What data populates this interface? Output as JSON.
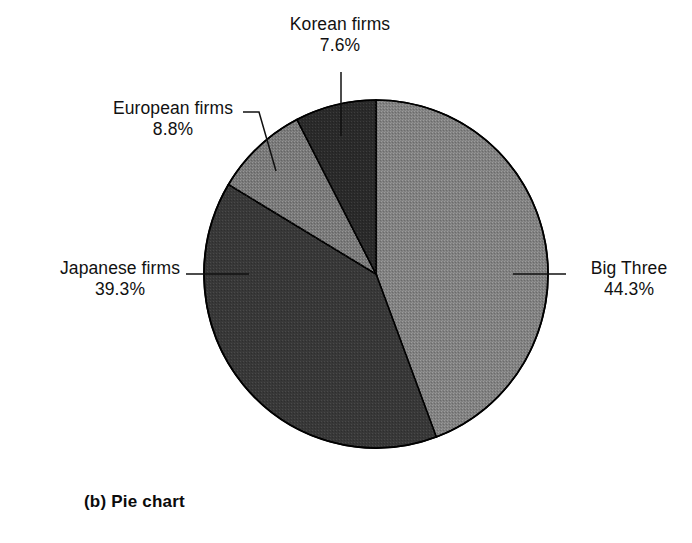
{
  "figure": {
    "caption": "(b) Pie chart",
    "background_color": "#ffffff",
    "text_color": "#111111"
  },
  "chart_data": {
    "type": "pie",
    "title": "",
    "subtitle": "",
    "xlabel": "",
    "ylabel": "",
    "grid": false,
    "legend_position": "none",
    "label_style": "outside-with-leader-lines",
    "units": "percent",
    "total": 100.0,
    "start_angle_deg": 0,
    "direction": "clockwise",
    "categories": [
      "Big Three",
      "Japanese firms",
      "European firms",
      "Korean firms"
    ],
    "values": [
      44.3,
      39.3,
      8.8,
      7.6
    ],
    "value_labels": [
      "44.3%",
      "39.3%",
      "8.8%",
      "7.6%"
    ],
    "slices": [
      {
        "name": "Big Three",
        "value": 44.3,
        "value_label": "44.3%",
        "color": "#808080",
        "angle_deg": 159.5,
        "start_deg": 0.0,
        "end_deg": 159.5,
        "label_side": "right"
      },
      {
        "name": "Japanese firms",
        "value": 39.3,
        "value_label": "39.3%",
        "color": "#383838",
        "angle_deg": 141.5,
        "start_deg": 159.5,
        "end_deg": 301.0,
        "label_side": "left"
      },
      {
        "name": "European firms",
        "value": 8.8,
        "value_label": "8.8%",
        "color": "#787878",
        "angle_deg": 31.7,
        "start_deg": 301.0,
        "end_deg": 332.7,
        "label_side": "upper-left"
      },
      {
        "name": "Korean firms",
        "value": 7.6,
        "value_label": "7.6%",
        "color": "#2a2a2a",
        "angle_deg": 27.3,
        "start_deg": 332.7,
        "end_deg": 360.0,
        "label_side": "top"
      }
    ],
    "outline_color": "#000000"
  },
  "labels": {
    "korean": {
      "name": "Korean firms",
      "value": "7.6%"
    },
    "european": {
      "name": "European firms",
      "value": "8.8%"
    },
    "japanese": {
      "name": "Japanese firms",
      "value": "39.3%"
    },
    "bigthree": {
      "name": "Big Three",
      "value": "44.3%"
    }
  }
}
